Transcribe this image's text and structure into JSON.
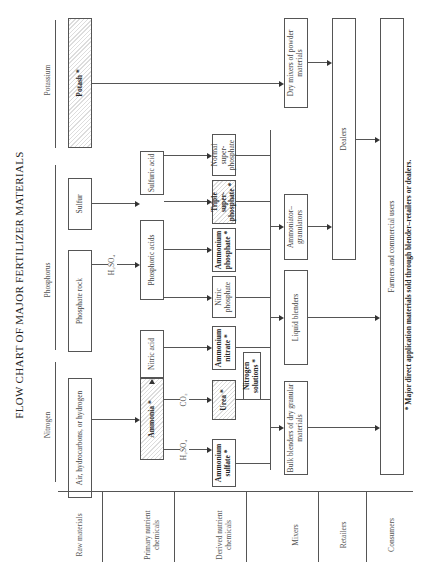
{
  "title": "FLOW CHART OF MAJOR FERTILIZER MATERIALS",
  "footnote": "* Major direct application materials sold through blender–retailers or dealers.",
  "nutrient_headers": {
    "nitrogen": "Nitrogen",
    "phosphorus": "Phosphorus",
    "potassium": "Potassium"
  },
  "stages": {
    "raw": "Raw materials",
    "primary": "Primary nutrient chemicals",
    "derived": "Derived nutrient chemicals",
    "mixers": "Mixers",
    "retailers": "Retailers",
    "consumers": "Consumers"
  },
  "nodes": {
    "air": "Air, hydrocarbons, or hydrogen",
    "phosphate_rock": "Phosphate rock",
    "sulfur": "Sulfur",
    "potash": "Potash *",
    "ammonia": "Ammonia *",
    "nitric_acid": "Nitric acid",
    "phosphoric_acids": "Phosphoric acids",
    "sulfuric_acid": "Sulfuric acid",
    "ammonium_sulfate": "Ammonium sulfate *",
    "urea": "Urea *",
    "nitrogen_solutions": "Nitrogen solutions *",
    "ammonium_nitrate": "Ammonium nitrate *",
    "nitric_phosphate": "Nitric phosphate",
    "ammonium_phosphate": "Ammonium phosphate *",
    "triple_superphosphate": "Triple super-phosphate *",
    "normal_superphosphate": "Normal super-phosphate",
    "bulk_blenders": "Bulk blenders of dry granular materials",
    "liquid_blenders": "Liquid blenders",
    "ammoniator": "Ammoniator–granulators",
    "dry_mixers": "Dry mixers of powder materials",
    "dealers": "Dealers",
    "farmers": "Farmers and commercial users"
  },
  "reagents": {
    "h2so4_phosphate": "H₂SO₄",
    "h2so4_ammonium": "H₂SO₄",
    "co2_urea": "CO₂"
  }
}
